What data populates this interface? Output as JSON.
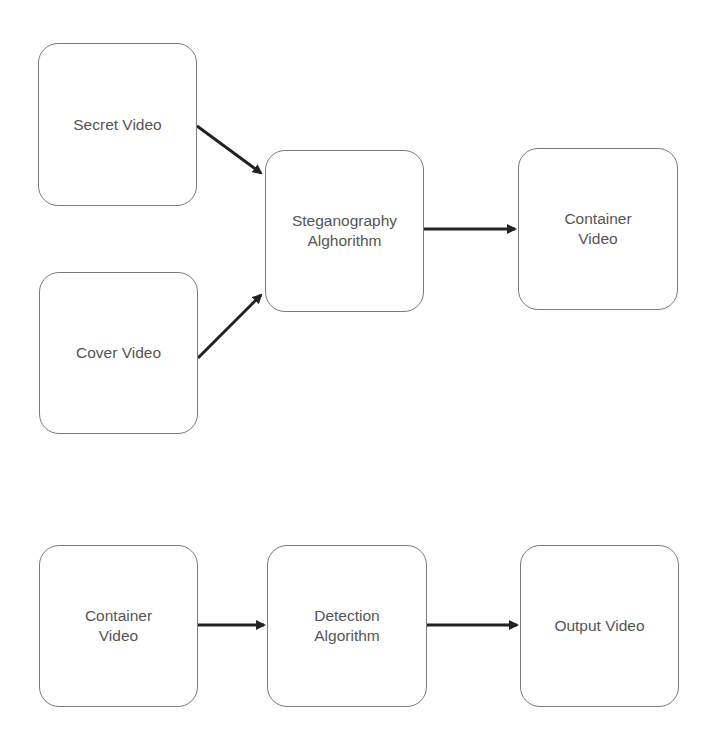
{
  "diagram": {
    "type": "flowchart",
    "colors": {
      "background": "#ffffff",
      "node_border": "#7a7a7a",
      "node_text": "#555555",
      "arrow": "#222222"
    },
    "embedding_flow": {
      "nodes": [
        {
          "id": "secret-video",
          "label": "Secret Video"
        },
        {
          "id": "cover-video",
          "label": "Cover Video"
        },
        {
          "id": "steganography-algorithm",
          "label": "Steganography\nAlghorithm"
        },
        {
          "id": "container-video-out",
          "label": "Container\nVideo"
        }
      ],
      "edges": [
        {
          "from": "secret-video",
          "to": "steganography-algorithm"
        },
        {
          "from": "cover-video",
          "to": "steganography-algorithm"
        },
        {
          "from": "steganography-algorithm",
          "to": "container-video-out"
        }
      ]
    },
    "detection_flow": {
      "nodes": [
        {
          "id": "container-video-in",
          "label": "Container\nVideo"
        },
        {
          "id": "detection-algorithm",
          "label": "Detection\nAlgorithm"
        },
        {
          "id": "output-video",
          "label": "Output Video"
        }
      ],
      "edges": [
        {
          "from": "container-video-in",
          "to": "detection-algorithm"
        },
        {
          "from": "detection-algorithm",
          "to": "output-video"
        }
      ]
    }
  }
}
